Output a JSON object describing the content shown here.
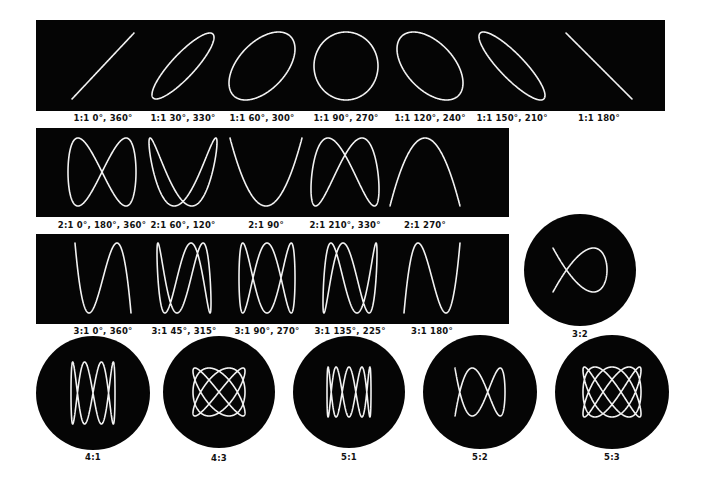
{
  "diagram": {
    "colors": {
      "background": "#ffffff",
      "panel": "#050505",
      "trace": "#f2f2f2",
      "label": "#111111"
    },
    "rows": [
      {
        "ratio": "1:1",
        "panel": {
          "x": 36,
          "y": 20,
          "w": 629,
          "h": 91
        },
        "label_y": 113,
        "figures": [
          {
            "label": "1:1 0°, 360°",
            "cx": 103,
            "cy": 66,
            "fx": 1,
            "fy": 1,
            "phase": 0,
            "w": 62,
            "h": 66
          },
          {
            "label": "1:1 30°, 330°",
            "cx": 183,
            "cy": 66,
            "fx": 1,
            "fy": 1,
            "phase": 30,
            "w": 62,
            "h": 66
          },
          {
            "label": "1:1 60°, 300°",
            "cx": 262,
            "cy": 66,
            "fx": 1,
            "fy": 1,
            "phase": 60,
            "w": 66,
            "h": 68
          },
          {
            "label": "1:1 90°, 270°",
            "cx": 346,
            "cy": 66,
            "fx": 1,
            "fy": 1,
            "phase": 90,
            "w": 64,
            "h": 68
          },
          {
            "label": "1:1 120°, 240°",
            "cx": 430,
            "cy": 66,
            "fx": 1,
            "fy": 1,
            "phase": 120,
            "w": 66,
            "h": 68
          },
          {
            "label": "1:1 150°, 210°",
            "cx": 512,
            "cy": 66,
            "fx": 1,
            "fy": 1,
            "phase": 150,
            "w": 66,
            "h": 68
          },
          {
            "label": "1:1 180°",
            "cx": 599,
            "cy": 66,
            "fx": 1,
            "fy": 1,
            "phase": 180,
            "w": 66,
            "h": 66
          }
        ]
      },
      {
        "ratio": "2:1",
        "panel": {
          "x": 36,
          "y": 128,
          "w": 473,
          "h": 89
        },
        "label_y": 220,
        "figures": [
          {
            "label": "2:1 0°, 180°, 360°",
            "cx": 102,
            "cy": 172,
            "fx": 1,
            "fy": 2,
            "phase": 0,
            "w": 68,
            "h": 68,
            "mode": "fig8"
          },
          {
            "label": "2:1 60°, 120°",
            "cx": 183,
            "cy": 172,
            "fx": 1,
            "fy": 2,
            "phase": 60,
            "w": 68,
            "h": 68,
            "mode": "fig8"
          },
          {
            "label": "2:1 90°",
            "cx": 266,
            "cy": 172,
            "fx": 1,
            "fy": 2,
            "phase": 90,
            "w": 72,
            "h": 68,
            "mode": "fig8"
          },
          {
            "label": "2:1 210°, 330°",
            "cx": 345,
            "cy": 172,
            "fx": 1,
            "fy": 2,
            "phase": 210,
            "w": 68,
            "h": 68,
            "mode": "fig8"
          },
          {
            "label": "2:1 270°",
            "cx": 425,
            "cy": 172,
            "fx": 1,
            "fy": 2,
            "phase": 270,
            "w": 70,
            "h": 68,
            "mode": "fig8"
          }
        ]
      },
      {
        "ratio": "3:1",
        "panel": {
          "x": 36,
          "y": 234,
          "w": 473,
          "h": 90
        },
        "label_y": 326,
        "figures": [
          {
            "label": "3:1 0°, 360°",
            "cx": 103,
            "cy": 278,
            "fx": 3,
            "fy": 1,
            "phase": 0,
            "w": 56,
            "h": 70,
            "mode": "xfreq"
          },
          {
            "label": "3:1 45°, 315°",
            "cx": 184,
            "cy": 278,
            "fx": 3,
            "fy": 1,
            "phase": 45,
            "w": 54,
            "h": 70,
            "mode": "xfreq"
          },
          {
            "label": "3:1 90°, 270°",
            "cx": 267,
            "cy": 278,
            "fx": 3,
            "fy": 1,
            "phase": 90,
            "w": 56,
            "h": 70,
            "mode": "xfreq"
          },
          {
            "label": "3:1 135°, 225°",
            "cx": 350,
            "cy": 278,
            "fx": 3,
            "fy": 1,
            "phase": 135,
            "w": 54,
            "h": 70,
            "mode": "xfreq"
          },
          {
            "label": "3:1 180°",
            "cx": 432,
            "cy": 278,
            "fx": 3,
            "fy": 1,
            "phase": 180,
            "w": 56,
            "h": 70,
            "mode": "xfreq"
          }
        ]
      }
    ],
    "discs": [
      {
        "label": "3:2",
        "cx": 580,
        "cy": 270,
        "r": 56,
        "a": 3,
        "b": 2,
        "phase": 90,
        "w": 54,
        "h": 44,
        "label_y": 329
      },
      {
        "label": "4:1",
        "cx": 93,
        "cy": 393,
        "r": 57,
        "a": 4,
        "b": 1,
        "phase": 90,
        "w": 44,
        "h": 62,
        "label_y": 452
      },
      {
        "label": "4:3",
        "cx": 219,
        "cy": 392,
        "r": 56,
        "a": 4,
        "b": 3,
        "phase": 90,
        "w": 52,
        "h": 48,
        "label_y": 453
      },
      {
        "label": "5:1",
        "cx": 349,
        "cy": 392,
        "r": 56,
        "a": 5,
        "b": 1,
        "phase": 90,
        "w": 44,
        "h": 50,
        "label_y": 452
      },
      {
        "label": "5:2",
        "cx": 480,
        "cy": 392,
        "r": 57,
        "a": 5,
        "b": 2,
        "phase": 90,
        "w": 50,
        "h": 48,
        "label_y": 452
      },
      {
        "label": "5:3",
        "cx": 612,
        "cy": 392,
        "r": 57,
        "a": 5,
        "b": 3,
        "phase": 90,
        "w": 58,
        "h": 50,
        "label_y": 452
      }
    ]
  }
}
